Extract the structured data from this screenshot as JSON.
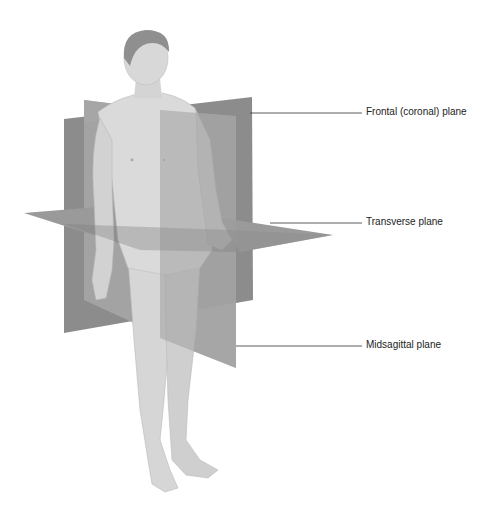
{
  "diagram": {
    "colors": {
      "background": "#ffffff",
      "plane_dark": "#8a8a8a",
      "plane_mid": "#9c9c9c",
      "plane_light": "#b4b4b4",
      "skin": "#d9d9d9",
      "skin_shadow": "#bcbcbc",
      "hair": "#8f8f8f",
      "leader_line": "#333333",
      "label_text": "#222222"
    },
    "labels": [
      {
        "id": "frontal",
        "text": "Frontal (coronal) plane",
        "x": 366,
        "y": 108,
        "line_from_x": 250,
        "line_y": 113
      },
      {
        "id": "transverse",
        "text": "Transverse plane",
        "x": 366,
        "y": 218,
        "line_from_x": 270,
        "line_y": 223
      },
      {
        "id": "midsagittal",
        "text": "Midsagittal plane",
        "x": 366,
        "y": 341,
        "line_from_x": 236,
        "line_y": 346
      }
    ]
  }
}
